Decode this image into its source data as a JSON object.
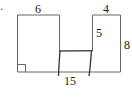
{
  "problem": {
    "marker": "."
  },
  "diagram": {
    "stroke_color": "#555555",
    "pen_color": "#333333",
    "labels": {
      "top_left_width": "6",
      "top_right_width": "4",
      "notch_depth": "5",
      "right_height": "8",
      "bottom_length": "15"
    },
    "right_angle_marker": true
  }
}
